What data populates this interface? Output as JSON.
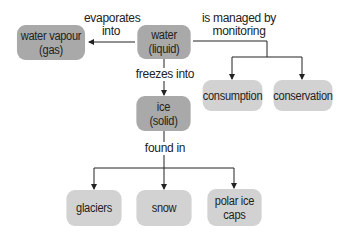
{
  "diagram": {
    "colors": {
      "primary_node": "#a9a9a9",
      "secondary_node": "#d2d2d2",
      "line": "#222222",
      "text": "#222222"
    },
    "nodes": {
      "water_vapour": {
        "line1": "water vapour",
        "line2": "(gas)"
      },
      "water": {
        "line1": "water",
        "line2": "(liquid)"
      },
      "ice": {
        "line1": "ice",
        "line2": "(solid)"
      },
      "consumption": {
        "line1": "consumption"
      },
      "conservation": {
        "line1": "conservation"
      },
      "glaciers": {
        "line1": "glaciers"
      },
      "snow": {
        "line1": "snow"
      },
      "polar_ice_caps": {
        "line1": "polar ice",
        "line2": "caps"
      }
    },
    "edges": {
      "evaporates_into": {
        "line1": "evaporates",
        "line2": "into"
      },
      "managed_by": {
        "line1": "is managed by",
        "line2": "monitoring"
      },
      "freezes_into": {
        "line1": "freezes into"
      },
      "found_in": {
        "line1": "found in"
      }
    }
  }
}
